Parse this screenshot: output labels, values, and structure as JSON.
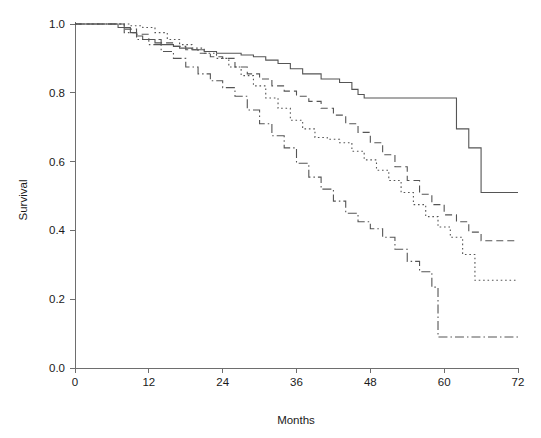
{
  "chart_data": {
    "type": "line",
    "subtype": "kaplan-meier-step",
    "title": "",
    "subtitle": "",
    "xlabel": "Months",
    "ylabel": "Survival",
    "xlim": [
      0,
      72
    ],
    "ylim": [
      0.0,
      1.0
    ],
    "xticks": [
      0,
      12,
      24,
      36,
      48,
      60,
      72
    ],
    "xticklabels": [
      "0",
      "12",
      "24",
      "36",
      "48",
      "60",
      "72"
    ],
    "yticks": [
      0.0,
      0.2,
      0.4,
      0.6,
      0.8,
      1.0
    ],
    "yticklabels": [
      "0.0",
      "0.2",
      "0.4",
      "0.6",
      "0.8",
      "1.0"
    ],
    "grid": false,
    "legend": false,
    "legend_position": "none",
    "line_color": "#555555",
    "axis_color": "#6e6e6e",
    "background": "#ffffff",
    "series": [
      {
        "name": "group-1-solid",
        "style": "solid",
        "dasharray": "",
        "final_value": 0.51,
        "x": [
          0,
          5,
          7,
          9,
          10,
          11,
          13,
          14,
          16,
          17,
          19,
          21,
          23,
          25,
          27,
          29,
          31,
          33,
          35,
          37,
          40,
          43,
          45,
          46,
          47,
          50,
          53,
          56,
          59,
          62,
          64,
          66,
          72
        ],
        "y": [
          1.0,
          1.0,
          0.99,
          0.975,
          0.965,
          0.955,
          0.945,
          0.94,
          0.935,
          0.93,
          0.925,
          0.92,
          0.915,
          0.915,
          0.91,
          0.905,
          0.895,
          0.885,
          0.87,
          0.855,
          0.84,
          0.83,
          0.81,
          0.795,
          0.785,
          0.785,
          0.785,
          0.785,
          0.785,
          0.695,
          0.64,
          0.51,
          0.51
        ]
      },
      {
        "name": "group-2-dashed",
        "style": "dashed",
        "dasharray": "7,4",
        "final_value": 0.37,
        "x": [
          0,
          6,
          8,
          10,
          12,
          14,
          16,
          18,
          20,
          22,
          24,
          26,
          28,
          30,
          32,
          34,
          36,
          38,
          40,
          42,
          44,
          46,
          48,
          50,
          52,
          54,
          56,
          58,
          60,
          62,
          64,
          66,
          72
        ],
        "y": [
          1.0,
          1.0,
          0.985,
          0.97,
          0.955,
          0.945,
          0.935,
          0.925,
          0.915,
          0.905,
          0.9,
          0.875,
          0.855,
          0.84,
          0.82,
          0.805,
          0.79,
          0.775,
          0.755,
          0.735,
          0.71,
          0.685,
          0.655,
          0.62,
          0.585,
          0.545,
          0.505,
          0.475,
          0.445,
          0.425,
          0.395,
          0.37,
          0.37
        ]
      },
      {
        "name": "group-3-dotted",
        "style": "dotted",
        "dasharray": "1.6,2.8",
        "final_value": 0.255,
        "x": [
          0,
          7,
          9,
          11,
          13,
          15,
          17,
          19,
          21,
          23,
          25,
          27,
          29,
          31,
          33,
          35,
          37,
          39,
          41,
          43,
          45,
          47,
          49,
          51,
          53,
          55,
          57,
          59,
          61,
          63,
          65,
          72
        ],
        "y": [
          1.0,
          1.0,
          0.995,
          0.99,
          0.975,
          0.955,
          0.94,
          0.93,
          0.915,
          0.9,
          0.875,
          0.85,
          0.82,
          0.785,
          0.755,
          0.72,
          0.695,
          0.67,
          0.665,
          0.655,
          0.63,
          0.605,
          0.575,
          0.545,
          0.51,
          0.475,
          0.44,
          0.41,
          0.38,
          0.33,
          0.255,
          0.255
        ]
      },
      {
        "name": "group-4-dashdot",
        "style": "dashdot",
        "dasharray": "9,3,1.5,3",
        "final_value": 0.09,
        "x": [
          0,
          5,
          8,
          10,
          12,
          14,
          16,
          18,
          20,
          22,
          24,
          26,
          28,
          30,
          32,
          34,
          36,
          38,
          40,
          42,
          44,
          46,
          48,
          50,
          52,
          54,
          56,
          58,
          59,
          72
        ],
        "y": [
          1.0,
          1.0,
          0.975,
          0.955,
          0.94,
          0.92,
          0.9,
          0.875,
          0.855,
          0.835,
          0.815,
          0.79,
          0.75,
          0.71,
          0.675,
          0.64,
          0.595,
          0.555,
          0.52,
          0.485,
          0.45,
          0.425,
          0.405,
          0.38,
          0.345,
          0.31,
          0.28,
          0.235,
          0.09,
          0.09
        ]
      }
    ]
  },
  "axis": {
    "x_title": "Months",
    "y_title": "Survival"
  }
}
